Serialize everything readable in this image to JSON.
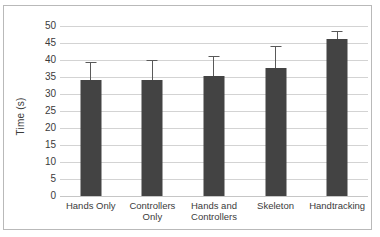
{
  "chart_data": {
    "type": "bar",
    "title": "",
    "xlabel": "",
    "ylabel": "Time (s)",
    "ylim": [
      0,
      50
    ],
    "yticks": [
      50,
      45,
      40,
      35,
      30,
      25,
      20,
      15,
      10,
      5,
      0
    ],
    "grid": true,
    "legend": false,
    "bar_color": "#434343",
    "errorbar_color": "#595959",
    "gridline_color": "#d3d3d3",
    "categories": [
      "Hands Only",
      "Controllers Only",
      "Hands and Controllers",
      "Skeleton",
      "Handtracking"
    ],
    "category_lines": [
      [
        "Hands Only"
      ],
      [
        "Controllers",
        "Only"
      ],
      [
        "Hands and",
        "Controllers"
      ],
      [
        "Skeleton"
      ],
      [
        "Handtracking"
      ]
    ],
    "values": [
      34.0,
      34.2,
      35.2,
      37.7,
      46.2
    ],
    "error_upper": [
      39.5,
      40.0,
      41.3,
      44.2,
      48.6
    ],
    "error_values": [
      5.5,
      5.8,
      6.1,
      6.5,
      2.4
    ]
  }
}
